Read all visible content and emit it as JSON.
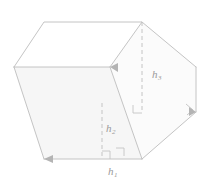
{
  "figure": {
    "type": "geometry-diagram",
    "canvas": {
      "width": 211,
      "height": 185
    },
    "colors": {
      "edge": "#b9b9b9",
      "edge_light": "#d2d2d2",
      "dashed": "#c0c0c0",
      "label": "#9a9a9a",
      "face_shade": "#f4f4f4",
      "background": "#ffffff"
    },
    "labels": [
      {
        "id": "h3",
        "base": "h",
        "subscript": "3",
        "x": 152,
        "y": 69
      },
      {
        "id": "h2",
        "base": "h",
        "subscript": "2",
        "x": 106,
        "y": 123
      },
      {
        "id": "h1",
        "base": "h",
        "subscript": "1",
        "x": 108,
        "y": 166
      }
    ],
    "vertices": {
      "top_apex": [
        142,
        22
      ],
      "top_left": [
        44,
        22
      ],
      "left": [
        14,
        67
      ],
      "mid_right": [
        110,
        67
      ],
      "bottom_left": [
        44,
        159
      ],
      "bottom_right": [
        142,
        159
      ],
      "right": [
        196,
        112
      ],
      "right_lower": [
        196,
        67
      ]
    },
    "dashed_segments": [
      {
        "id": "h3-segment",
        "from": [
          142,
          22
        ],
        "to": [
          142,
          113
        ]
      },
      {
        "id": "h2-segment",
        "from": [
          102,
          106
        ],
        "to": [
          102,
          159
        ]
      }
    ],
    "right_angle_markers": [
      {
        "id": "h3-right-angle",
        "x": 142,
        "y": 113
      },
      {
        "id": "h2-right-angle",
        "x": 102,
        "y": 159
      },
      {
        "id": "base-right-angle",
        "x": 124,
        "y": 155
      },
      {
        "id": "face-right-angle",
        "x": 188,
        "y": 110
      }
    ],
    "arrow_heads": [
      {
        "id": "arrow-mid-right",
        "x": 110,
        "y": 67,
        "direction": "left"
      },
      {
        "id": "arrow-bottom-left",
        "x": 44,
        "y": 159,
        "direction": "left"
      },
      {
        "id": "arrow-right",
        "x": 196,
        "y": 112,
        "direction": "right"
      }
    ]
  }
}
